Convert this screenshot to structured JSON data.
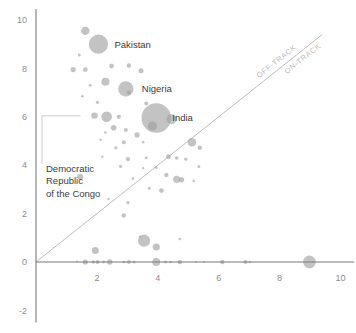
{
  "chart_data": {
    "type": "scatter",
    "title": "",
    "subtitle": "",
    "xlabel": "",
    "ylabel": "",
    "xlim": [
      -0.35,
      10.4
    ],
    "ylim": [
      -2.6,
      10.4
    ],
    "grid": false,
    "legend_position": "none",
    "x_ticks": [
      0,
      2,
      4,
      6,
      8,
      10
    ],
    "x_tick_labels": [
      "0",
      "2",
      "4",
      "6",
      "8",
      "10"
    ],
    "y_ticks": [
      -2,
      0,
      2,
      4,
      6,
      8,
      10
    ],
    "y_tick_labels": [
      "-2",
      "0",
      "2",
      "4",
      "6",
      "8",
      "10"
    ],
    "bubble_color": "#9e9e9e",
    "bubble_opacity": 0.62,
    "axis_color": "#7a7a7a",
    "reference_line": {
      "label_above": "OFF-TRACK",
      "label_below": "ON-TRACK",
      "x0": 0,
      "y0": 0,
      "x1": 9.4,
      "y1": 9.4,
      "color": "#b5b5b5"
    },
    "annotations": [
      {
        "label": "Pakistan",
        "x": 2.05,
        "y": 9.0
      },
      {
        "label": "Nigeria",
        "x": 2.95,
        "y": 7.15
      },
      {
        "label": "India",
        "x": 3.95,
        "y": 5.95
      },
      {
        "label": "Democratic\nRepublic\nof the Congo",
        "x": 1.45,
        "y": 6.0
      }
    ],
    "points": [
      {
        "x": 1.62,
        "y": 9.55,
        "r": 4.2
      },
      {
        "x": 2.05,
        "y": 9.0,
        "r": 9.6
      },
      {
        "x": 1.42,
        "y": 8.55,
        "r": 1.5
      },
      {
        "x": 1.22,
        "y": 7.95,
        "r": 2.6
      },
      {
        "x": 1.62,
        "y": 7.95,
        "r": 2.3
      },
      {
        "x": 2.48,
        "y": 8.1,
        "r": 2.4
      },
      {
        "x": 3.05,
        "y": 8.12,
        "r": 2.2
      },
      {
        "x": 3.45,
        "y": 7.9,
        "r": 2.5
      },
      {
        "x": 2.28,
        "y": 7.45,
        "r": 4.0
      },
      {
        "x": 1.78,
        "y": 7.3,
        "r": 1.4
      },
      {
        "x": 2.95,
        "y": 7.15,
        "r": 7.6
      },
      {
        "x": 3.05,
        "y": 7.0,
        "r": 2.0
      },
      {
        "x": 1.52,
        "y": 6.85,
        "r": 1.3
      },
      {
        "x": 2.02,
        "y": 6.6,
        "r": 1.6
      },
      {
        "x": 3.62,
        "y": 6.55,
        "r": 2.0
      },
      {
        "x": 1.92,
        "y": 6.05,
        "r": 3.2
      },
      {
        "x": 2.32,
        "y": 6.0,
        "r": 5.3
      },
      {
        "x": 2.72,
        "y": 6.0,
        "r": 2.1
      },
      {
        "x": 3.95,
        "y": 5.95,
        "r": 14.8
      },
      {
        "x": 4.45,
        "y": 5.9,
        "r": 5.0
      },
      {
        "x": 3.82,
        "y": 5.62,
        "r": 4.6
      },
      {
        "x": 2.55,
        "y": 5.55,
        "r": 2.8
      },
      {
        "x": 2.95,
        "y": 5.45,
        "r": 2.0
      },
      {
        "x": 2.28,
        "y": 5.35,
        "r": 1.3
      },
      {
        "x": 3.32,
        "y": 5.25,
        "r": 2.6
      },
      {
        "x": 2.12,
        "y": 5.05,
        "r": 1.2
      },
      {
        "x": 2.88,
        "y": 4.95,
        "r": 2.0
      },
      {
        "x": 3.52,
        "y": 4.95,
        "r": 1.3
      },
      {
        "x": 2.62,
        "y": 4.72,
        "r": 1.5
      },
      {
        "x": 5.12,
        "y": 4.95,
        "r": 4.3
      },
      {
        "x": 5.38,
        "y": 4.72,
        "r": 2.2
      },
      {
        "x": 2.18,
        "y": 4.35,
        "r": 1.2
      },
      {
        "x": 3.02,
        "y": 4.25,
        "r": 2.1
      },
      {
        "x": 3.62,
        "y": 4.3,
        "r": 1.4
      },
      {
        "x": 4.35,
        "y": 4.35,
        "r": 2.4
      },
      {
        "x": 4.62,
        "y": 4.3,
        "r": 1.8
      },
      {
        "x": 4.92,
        "y": 4.25,
        "r": 1.6
      },
      {
        "x": 2.78,
        "y": 3.95,
        "r": 1.6
      },
      {
        "x": 3.52,
        "y": 3.88,
        "r": 1.2
      },
      {
        "x": 3.95,
        "y": 3.9,
        "r": 1.4
      },
      {
        "x": 5.35,
        "y": 3.95,
        "r": 1.5
      },
      {
        "x": 4.28,
        "y": 3.6,
        "r": 2.2
      },
      {
        "x": 1.45,
        "y": 3.52,
        "r": 3.1
      },
      {
        "x": 3.18,
        "y": 3.45,
        "r": 1.3
      },
      {
        "x": 4.62,
        "y": 3.42,
        "r": 3.6
      },
      {
        "x": 4.78,
        "y": 3.4,
        "r": 2.6
      },
      {
        "x": 5.18,
        "y": 3.35,
        "r": 1.3
      },
      {
        "x": 3.72,
        "y": 3.05,
        "r": 1.5
      },
      {
        "x": 4.12,
        "y": 2.95,
        "r": 2.4
      },
      {
        "x": 2.38,
        "y": 2.6,
        "r": 1.2
      },
      {
        "x": 3.02,
        "y": 2.45,
        "r": 1.6
      },
      {
        "x": 2.88,
        "y": 1.92,
        "r": 2.2
      },
      {
        "x": 3.42,
        "y": 1.05,
        "r": 1.2
      },
      {
        "x": 3.55,
        "y": 0.88,
        "r": 6.1
      },
      {
        "x": 3.95,
        "y": 0.62,
        "r": 3.6
      },
      {
        "x": 4.72,
        "y": 0.95,
        "r": 1.3
      },
      {
        "x": 1.95,
        "y": 0.48,
        "r": 3.5
      },
      {
        "x": 1.35,
        "y": 0.02,
        "r": 1.0
      },
      {
        "x": 1.62,
        "y": 0.0,
        "r": 2.6
      },
      {
        "x": 1.88,
        "y": 0.0,
        "r": 1.8
      },
      {
        "x": 2.02,
        "y": 0.0,
        "r": 2.1
      },
      {
        "x": 2.22,
        "y": 0.0,
        "r": 1.4
      },
      {
        "x": 2.42,
        "y": 0.0,
        "r": 2.8
      },
      {
        "x": 2.88,
        "y": 0.0,
        "r": 1.3
      },
      {
        "x": 3.05,
        "y": 0.0,
        "r": 2.0
      },
      {
        "x": 3.22,
        "y": 0.0,
        "r": 1.5
      },
      {
        "x": 3.95,
        "y": 0.0,
        "r": 4.0
      },
      {
        "x": 4.25,
        "y": 0.0,
        "r": 1.5
      },
      {
        "x": 4.42,
        "y": 0.0,
        "r": 1.2
      },
      {
        "x": 4.72,
        "y": 0.0,
        "r": 2.2
      },
      {
        "x": 5.25,
        "y": 0.0,
        "r": 1.1
      },
      {
        "x": 5.52,
        "y": 0.0,
        "r": 1.0
      },
      {
        "x": 6.12,
        "y": 0.0,
        "r": 2.2
      },
      {
        "x": 6.88,
        "y": 0.0,
        "r": 2.0
      },
      {
        "x": 7.02,
        "y": 0.0,
        "r": 1.2
      },
      {
        "x": 8.98,
        "y": 0.0,
        "r": 6.4
      }
    ]
  }
}
